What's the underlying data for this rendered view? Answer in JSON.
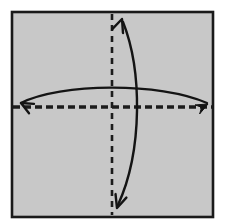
{
  "figure": {
    "caption": "Square sheet with horizontal and vertical valley fold lines and two double-headed curved fold arrows",
    "canvas": {
      "width": 225,
      "height": 223,
      "background": "#ffffff"
    }
  },
  "paper": {
    "name": "paper-square",
    "label": "Square sheet of paper",
    "x": 12,
    "y": 12,
    "width": 201,
    "height": 205,
    "fill": "#c8c8c8",
    "stroke": "#1a1a1a",
    "stroke_width": 2.6
  },
  "fold_lines": [
    {
      "name": "horizontal-fold-line",
      "label": "Horizontal fold crease",
      "orientation": "horizontal",
      "position": 107,
      "start": 13,
      "end": 212,
      "stroke": "#1c1c1c",
      "stroke_width": 3.6,
      "dash": "7 4",
      "style": "dashed"
    },
    {
      "name": "vertical-fold-line",
      "label": "Vertical fold crease",
      "orientation": "vertical",
      "position": 112,
      "start": 14,
      "end": 215,
      "stroke": "#1c1c1c",
      "stroke_width": 2.6,
      "dash": "6 5",
      "style": "dashed"
    }
  ],
  "arrows": [
    {
      "name": "horizontal-fold-arrow",
      "label": "Horizontal fold direction arrow",
      "type": "double-headed-curve",
      "path": "M 21 103 C 60 83, 160 82, 207 103",
      "stroke": "#141414",
      "stroke_width": 2.4,
      "head_start": {
        "x": 21,
        "y": 103,
        "angle": 208,
        "style": "open",
        "size": 13
      },
      "head_end": {
        "x": 208,
        "y": 104,
        "angle": 333,
        "style": "solid",
        "size": 13
      }
    },
    {
      "name": "vertical-fold-arrow",
      "label": "Vertical fold direction arrow",
      "type": "double-headed-curve",
      "path": "M 123 22 C 142 70, 143 150, 118 205",
      "stroke": "#141414",
      "stroke_width": 2.4,
      "head_start": {
        "x": 122,
        "y": 19,
        "angle": 290,
        "style": "open",
        "size": 14
      },
      "head_end": {
        "x": 117,
        "y": 208,
        "angle": 108,
        "style": "open",
        "size": 14
      }
    }
  ],
  "colors": {
    "paper_fill": "#c8c8c8",
    "ink": "#1a1a1a",
    "background": "#ffffff"
  }
}
